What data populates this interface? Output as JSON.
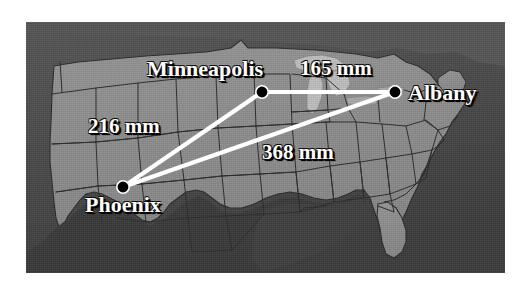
{
  "figure": {
    "type": "map-diagram",
    "background_color": "#ffffff",
    "map": {
      "region_name": "United States",
      "land_color": "#8c8c8c",
      "water_color": "#bdbdbd",
      "outside_color": "#454545",
      "border_color": "#2b2b2b",
      "frame": {
        "x": 26,
        "y": 22,
        "width": 479,
        "height": 251
      }
    },
    "overlay_color": "#ffffff",
    "marker_color": "#000000"
  },
  "cities": [
    {
      "id": "minneapolis",
      "label": "Minneapolis",
      "x": 236,
      "y": 70
    },
    {
      "id": "albany",
      "label": "Albany",
      "x": 369,
      "y": 70
    },
    {
      "id": "phoenix",
      "label": "Phoenix",
      "x": 97,
      "y": 165
    }
  ],
  "distances": [
    {
      "id": "minneapolis-albany",
      "from": "Minneapolis",
      "to": "Albany",
      "value": 165,
      "unit": "mm",
      "label": "165 mm"
    },
    {
      "id": "phoenix-minneapolis",
      "from": "Phoenix",
      "to": "Minneapolis",
      "value": 216,
      "unit": "mm",
      "label": "216 mm"
    },
    {
      "id": "phoenix-albany",
      "from": "Phoenix",
      "to": "Albany",
      "value": 368,
      "unit": "mm",
      "label": "368 mm"
    }
  ],
  "labels": {
    "minneapolis": "Minneapolis",
    "albany": "Albany",
    "phoenix": "Phoenix",
    "d_minneapolis_albany": "165 mm",
    "d_phoenix_minneapolis": "216 mm",
    "d_phoenix_albany": "368 mm"
  }
}
